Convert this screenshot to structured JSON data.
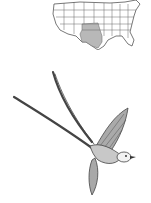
{
  "figure": {
    "map": {
      "region": "contiguous United States",
      "highlighted_range": "southern Great Plains (Texas, Oklahoma, Kansas)",
      "shade_color": "#b8b8b8",
      "outline_color": "#555555"
    },
    "illustration": {
      "style": "pen-and-ink drawing",
      "ink_color": "#444444"
    }
  }
}
